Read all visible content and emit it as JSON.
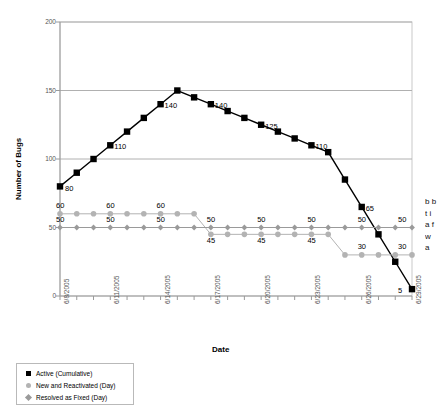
{
  "chart_data": {
    "type": "line",
    "title": "",
    "xlabel": "Date",
    "ylabel": "Number of Bugs",
    "ylim": [
      0,
      200
    ],
    "yticks": [
      0,
      50,
      100,
      150,
      200
    ],
    "grid": true,
    "legend_position": "below-left",
    "x": [
      "6/8/2005",
      "6/9/2005",
      "6/10/2005",
      "6/11/2005",
      "6/12/2005",
      "6/13/2005",
      "6/14/2005",
      "6/15/2005",
      "6/16/2005",
      "6/17/2005",
      "6/18/2005",
      "6/19/2005",
      "6/20/2005",
      "6/21/2005",
      "6/22/2005",
      "6/23/2005",
      "6/24/2005",
      "6/25/2005",
      "6/26/2005",
      "6/27/2005",
      "6/28/2005",
      "6/29/2005"
    ],
    "xtick_labels": [
      "6/8/2005",
      "6/11/2005",
      "6/14/2005",
      "6/17/2005",
      "6/20/2005",
      "6/23/2005",
      "6/26/2005",
      "6/29/2005"
    ],
    "xtick_indices": [
      0,
      3,
      6,
      9,
      12,
      15,
      18,
      21
    ],
    "series": [
      {
        "name": "Active (Cumulative)",
        "marker": "square",
        "color": "#000000",
        "values": [
          80,
          90,
          100,
          110,
          120,
          130,
          140,
          150,
          145,
          140,
          135,
          130,
          125,
          120,
          115,
          110,
          105,
          85,
          65,
          45,
          25,
          5
        ],
        "point_labels": [
          {
            "index": 0,
            "text": "80"
          },
          {
            "index": 3,
            "text": "110"
          },
          {
            "index": 6,
            "text": "140"
          },
          {
            "index": 9,
            "text": "140"
          },
          {
            "index": 12,
            "text": "125"
          },
          {
            "index": 15,
            "text": "110"
          },
          {
            "index": 18,
            "text": "65"
          },
          {
            "index": 21,
            "text": "5"
          }
        ]
      },
      {
        "name": "New and Reactivated (Day)",
        "marker": "circle",
        "color": "#b3b3b3",
        "values": [
          60,
          60,
          60,
          60,
          60,
          60,
          60,
          60,
          60,
          45,
          45,
          45,
          45,
          45,
          45,
          45,
          45,
          30,
          30,
          30,
          30,
          30
        ],
        "point_labels": [
          {
            "index": 0,
            "text": "60"
          },
          {
            "index": 3,
            "text": "60"
          },
          {
            "index": 6,
            "text": "60"
          },
          {
            "index": 9,
            "text": "45"
          },
          {
            "index": 12,
            "text": "45"
          },
          {
            "index": 15,
            "text": "45"
          },
          {
            "index": 18,
            "text": "30"
          },
          {
            "index": 21,
            "text": "30"
          }
        ]
      },
      {
        "name": "Resolved as Fixed (Day)",
        "marker": "diamond",
        "color": "#9a9a9a",
        "values": [
          50,
          50,
          50,
          50,
          50,
          50,
          50,
          50,
          50,
          50,
          50,
          50,
          50,
          50,
          50,
          50,
          50,
          50,
          50,
          50,
          50,
          50
        ],
        "point_labels": [
          {
            "index": 0,
            "text": "50"
          },
          {
            "index": 3,
            "text": "50"
          },
          {
            "index": 6,
            "text": "50"
          },
          {
            "index": 9,
            "text": "50"
          },
          {
            "index": 12,
            "text": "50"
          },
          {
            "index": 15,
            "text": "50"
          },
          {
            "index": 18,
            "text": "50"
          },
          {
            "index": 21,
            "text": "50"
          }
        ]
      }
    ]
  },
  "legend": {
    "items": [
      {
        "label": "Active (Cumulative)",
        "marker": "square"
      },
      {
        "label": "New and Reactivated (Day)",
        "marker": "circle"
      },
      {
        "label": "Resolved as Fixed (Day)",
        "marker": "diamond"
      }
    ]
  },
  "side_text": "b b t i a f w a"
}
